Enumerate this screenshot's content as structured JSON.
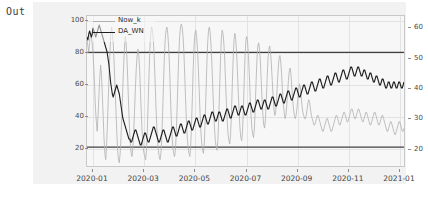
{
  "notebook": {
    "out_prompt": "Out"
  },
  "chart_data": {
    "type": "line",
    "title": "",
    "xlabel": "",
    "ylabel": "",
    "grid": true,
    "legend_position": "upper-left",
    "xtick_labels": [
      "2020-01",
      "2020-03",
      "2020-05",
      "2020-07",
      "2020-09",
      "2020-11",
      "2021-01"
    ],
    "left_axis": {
      "ticks": [
        20,
        40,
        60,
        80,
        100
      ],
      "ylim": [
        8,
        103
      ]
    },
    "right_axis": {
      "ticks": [
        20,
        30,
        40,
        50,
        60
      ],
      "ylim": [
        14,
        64
      ]
    },
    "threshold_lines": [
      {
        "value": 80,
        "axis": "left",
        "color": "#404040"
      },
      {
        "value": 20,
        "axis": "left",
        "color": "#404040"
      }
    ],
    "series": [
      {
        "name": "Now_k",
        "axis": "left",
        "color": "#b0b0b0",
        "linewidth": 0.8,
        "values": [
          88,
          84,
          80,
          86,
          92,
          90,
          86,
          80,
          70,
          58,
          44,
          36,
          30,
          40,
          52,
          64,
          72,
          66,
          54,
          40,
          26,
          16,
          12,
          20,
          34,
          50,
          66,
          80,
          92,
          96,
          92,
          84,
          72,
          58,
          44,
          30,
          18,
          12,
          10,
          16,
          26,
          40,
          56,
          70,
          82,
          90,
          86,
          76,
          62,
          46,
          32,
          22,
          16,
          14,
          20,
          30,
          44,
          58,
          70,
          78,
          82,
          78,
          68,
          54,
          40,
          28,
          20,
          16,
          14,
          12,
          18,
          30,
          48,
          66,
          82,
          92,
          96,
          94,
          88,
          78,
          64,
          48,
          34,
          24,
          18,
          14,
          12,
          16,
          26,
          42,
          60,
          76,
          88,
          94,
          96,
          92,
          84,
          72,
          56,
          40,
          28,
          20,
          16,
          14,
          18,
          28,
          44,
          62,
          78,
          90,
          96,
          98,
          96,
          90,
          80,
          66,
          50,
          36,
          26,
          20,
          16,
          14,
          20,
          34,
          52,
          70,
          84,
          92,
          94,
          90,
          82,
          70,
          56,
          42,
          30,
          22,
          18,
          16,
          22,
          36,
          54,
          72,
          86,
          94,
          96,
          92,
          84,
          72,
          58,
          44,
          32,
          24,
          20,
          18,
          24,
          38,
          56,
          74,
          88,
          94,
          92,
          86,
          76,
          62,
          48,
          36,
          28,
          24,
          22,
          28,
          42,
          60,
          76,
          88,
          92,
          88,
          80,
          68,
          54,
          42,
          32,
          26,
          24,
          30,
          44,
          62,
          78,
          88,
          90,
          86,
          78,
          66,
          52,
          40,
          32,
          28,
          26,
          32,
          46,
          62,
          76,
          84,
          86,
          82,
          74,
          62,
          50,
          40,
          34,
          32,
          38,
          50,
          64,
          76,
          82,
          84,
          80,
          72,
          62,
          52,
          44,
          40,
          42,
          50,
          60,
          70,
          76,
          78,
          74,
          66,
          56,
          48,
          42,
          38,
          40,
          46,
          54,
          62,
          68,
          70,
          66,
          58,
          50,
          44,
          40,
          38,
          40,
          44,
          50,
          56,
          60,
          58,
          52,
          46,
          42,
          40,
          38,
          38,
          40,
          44,
          48,
          50,
          48,
          44,
          40,
          38,
          36,
          34,
          34,
          36,
          38,
          40,
          40,
          38,
          36,
          34,
          32,
          30,
          30,
          32,
          34,
          36,
          38,
          38,
          36,
          34,
          32,
          30,
          30,
          32,
          34,
          36,
          38,
          40,
          40,
          38,
          36,
          34,
          34,
          36,
          38,
          40,
          42,
          42,
          40,
          38,
          36,
          36,
          38,
          40,
          42,
          44,
          44,
          42,
          40,
          38,
          38,
          40,
          42,
          44,
          44,
          42,
          40,
          38,
          36,
          36,
          38,
          40,
          42,
          42,
          40,
          38,
          36,
          34,
          34,
          36,
          38,
          40,
          42,
          42,
          40,
          38,
          36,
          34,
          34,
          36,
          38,
          40,
          40,
          38,
          36,
          34,
          32,
          30,
          30,
          32,
          34,
          36,
          36,
          34,
          32,
          30,
          28,
          28,
          30,
          32,
          34,
          36,
          36,
          34,
          32,
          30,
          30,
          32
        ]
      },
      {
        "name": "DA_WN",
        "axis": "right",
        "color": "#1f1f1f",
        "linewidth": 1.1,
        "values": [
          57,
          56,
          58,
          59,
          58,
          57,
          58,
          60,
          59,
          58,
          57,
          58,
          59,
          60,
          61,
          60,
          59,
          58,
          57,
          56,
          55,
          54,
          53,
          52,
          50,
          48,
          45,
          42,
          40,
          38,
          37,
          38,
          39,
          40,
          41,
          40,
          39,
          38,
          36,
          34,
          32,
          30,
          29,
          28,
          27,
          26,
          25,
          24,
          23,
          23,
          22,
          22,
          23,
          24,
          25,
          26,
          26,
          25,
          24,
          23,
          22,
          21,
          21,
          22,
          23,
          24,
          25,
          25,
          24,
          23,
          22,
          22,
          23,
          24,
          25,
          26,
          27,
          27,
          26,
          25,
          24,
          23,
          22,
          22,
          23,
          24,
          25,
          26,
          26,
          25,
          24,
          23,
          22,
          22,
          23,
          24,
          25,
          26,
          27,
          27,
          26,
          25,
          24,
          24,
          25,
          26,
          27,
          28,
          28,
          27,
          26,
          25,
          25,
          26,
          27,
          28,
          29,
          29,
          28,
          27,
          26,
          26,
          27,
          28,
          29,
          30,
          30,
          29,
          28,
          27,
          27,
          28,
          29,
          30,
          31,
          31,
          30,
          29,
          28,
          28,
          29,
          30,
          31,
          32,
          32,
          31,
          30,
          29,
          29,
          30,
          31,
          32,
          32,
          31,
          30,
          29,
          29,
          30,
          31,
          32,
          33,
          33,
          32,
          31,
          30,
          30,
          31,
          32,
          33,
          34,
          34,
          33,
          32,
          31,
          31,
          32,
          33,
          34,
          34,
          33,
          32,
          31,
          31,
          32,
          33,
          34,
          35,
          35,
          34,
          33,
          32,
          32,
          33,
          34,
          35,
          36,
          36,
          35,
          34,
          33,
          33,
          34,
          35,
          36,
          36,
          35,
          34,
          33,
          33,
          34,
          35,
          36,
          37,
          37,
          36,
          35,
          34,
          34,
          35,
          36,
          37,
          38,
          38,
          37,
          36,
          35,
          35,
          36,
          37,
          38,
          39,
          39,
          38,
          37,
          36,
          36,
          37,
          38,
          39,
          40,
          40,
          39,
          38,
          37,
          37,
          38,
          39,
          40,
          41,
          41,
          40,
          39,
          38,
          38,
          39,
          40,
          41,
          42,
          42,
          41,
          40,
          39,
          39,
          40,
          41,
          42,
          43,
          43,
          42,
          41,
          40,
          40,
          41,
          42,
          43,
          44,
          44,
          43,
          42,
          41,
          41,
          42,
          43,
          44,
          45,
          45,
          44,
          43,
          42,
          42,
          43,
          44,
          45,
          46,
          46,
          45,
          44,
          43,
          43,
          44,
          45,
          46,
          47,
          47,
          46,
          45,
          44,
          44,
          45,
          46,
          47,
          47,
          46,
          45,
          44,
          44,
          45,
          46,
          46,
          45,
          44,
          43,
          43,
          44,
          45,
          45,
          44,
          43,
          42,
          42,
          43,
          44,
          44,
          43,
          42,
          41,
          41,
          42,
          43,
          43,
          42,
          41,
          40,
          40,
          41,
          42,
          42,
          41,
          40,
          40,
          41,
          42,
          42,
          41,
          40,
          40,
          41,
          42,
          42,
          41,
          40,
          40,
          41,
          42
        ]
      }
    ]
  }
}
